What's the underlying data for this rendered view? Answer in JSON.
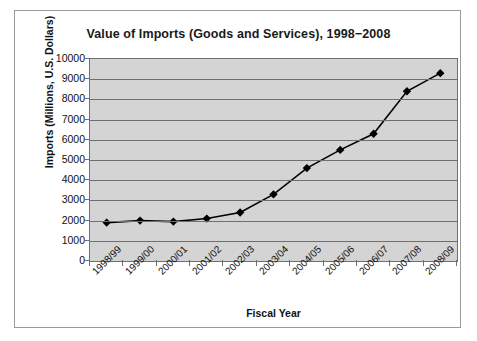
{
  "chart_data": {
    "type": "line",
    "title": "Value of Imports (Goods and Services), 1998−2008",
    "xlabel": "Fiscal Year",
    "ylabel": "Imports (Millions, U.S. Dollars)",
    "categories": [
      "1998/99",
      "1999/00",
      "2000/01",
      "2001/02",
      "2002/03",
      "2003/04",
      "2004/05",
      "2005/06",
      "2006/07",
      "2007/08",
      "2008/09"
    ],
    "values": [
      1900,
      2000,
      1950,
      2100,
      2400,
      3300,
      4600,
      5500,
      6300,
      8400,
      9300
    ],
    "series": [
      {
        "name": "Value of Imports",
        "values": [
          1900,
          2000,
          1950,
          2100,
          2400,
          3300,
          4600,
          5500,
          6300,
          8400,
          9300
        ]
      }
    ],
    "ylim": [
      0,
      10000
    ],
    "ytick_labels": [
      "10000",
      "9000",
      "8000",
      "7000",
      "6000",
      "5000",
      "4000",
      "3000",
      "2000",
      "1000",
      "0"
    ],
    "ytick_values": [
      10000,
      9000,
      8000,
      7000,
      6000,
      5000,
      4000,
      3000,
      2000,
      1000,
      0
    ],
    "grid": true,
    "grid_axis": "y",
    "legend": false,
    "marker": "diamond",
    "line_color": "#000000",
    "marker_color": "#000000",
    "plot_background": "#d4d4d4",
    "chart_background": "#ffffff",
    "grid_color": "#6f6f6f",
    "border_color": "#9a9a9a"
  }
}
